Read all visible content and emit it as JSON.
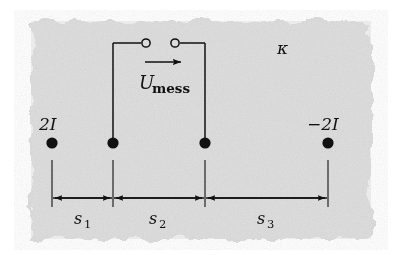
{
  "figure": {
    "name": "four-point-probe-current-measurement-diagram",
    "background_color": "#dcdcdc",
    "ink_color": "#111111",
    "paper_style": "torn-edge-gray-patch"
  },
  "labels": {
    "source_left": "2I",
    "source_right": "−2I",
    "conductivity": "κ",
    "voltage_main": "U",
    "voltage_sub": "mess",
    "dim1": "s",
    "dim1_sub": "1",
    "dim2": "s",
    "dim2_sub": "2",
    "dim3": "s",
    "dim3_sub": "3"
  },
  "electrodes": [
    {
      "name": "electrode-2I",
      "label": "2I",
      "x": 52,
      "y": 143
    },
    {
      "name": "electrode-probe-1",
      "label": "",
      "x": 113,
      "y": 143
    },
    {
      "name": "electrode-probe-2",
      "label": "",
      "x": 205,
      "y": 143
    },
    {
      "name": "electrode-minus-2I",
      "label": "−2I",
      "x": 328,
      "y": 143
    }
  ],
  "terminals": [
    {
      "name": "terminal-left",
      "x": 146,
      "y": 43
    },
    {
      "name": "terminal-right",
      "x": 175,
      "y": 43
    }
  ],
  "dimensions": [
    {
      "name": "dimension-s1",
      "label": "s",
      "sub": "1",
      "from_x": 52,
      "to_x": 113,
      "label_x": 83,
      "label_y": 222
    },
    {
      "name": "dimension-s2",
      "label": "s",
      "sub": "2",
      "from_x": 113,
      "to_x": 205,
      "label_x": 158,
      "label_y": 222
    },
    {
      "name": "dimension-s3",
      "label": "s",
      "sub": "3",
      "from_x": 205,
      "to_x": 328,
      "label_x": 266,
      "label_y": 222
    }
  ],
  "geometry": {
    "dimension_line_y": 198,
    "extension_top_y": 160,
    "extension_bottom_y": 207,
    "circuit_top_y": 43,
    "arrow_y": 62,
    "arrow_from_x": 145,
    "arrow_to_x": 183,
    "kappa_x": 283,
    "kappa_y": 52
  }
}
